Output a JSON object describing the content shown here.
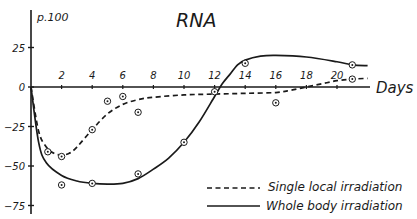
{
  "chart_data": {
    "type": "line",
    "title": "RNA",
    "ylabel": "p.100",
    "xlabel": "Days",
    "xlim": [
      0,
      22
    ],
    "ylim": [
      -75,
      35
    ],
    "x_ticks": [
      2,
      4,
      6,
      8,
      10,
      12,
      14,
      16,
      18,
      20
    ],
    "y_ticks": [
      25,
      0,
      -25,
      -50,
      -75
    ],
    "grid": false,
    "legend_position": "lower right",
    "series": [
      {
        "name": "Single local irradiation",
        "style": "dashed",
        "curve": [
          [
            0,
            0
          ],
          [
            0.5,
            -28
          ],
          [
            1,
            -38
          ],
          [
            1.5,
            -42
          ],
          [
            2,
            -43
          ],
          [
            2.5,
            -42
          ],
          [
            3,
            -38
          ],
          [
            4,
            -27
          ],
          [
            5,
            -17
          ],
          [
            6,
            -11
          ],
          [
            7,
            -8
          ],
          [
            8,
            -6.5
          ],
          [
            10,
            -5
          ],
          [
            12,
            -4.5
          ],
          [
            14,
            -4
          ],
          [
            16,
            -3.5
          ],
          [
            17,
            -2
          ],
          [
            18,
            0
          ],
          [
            19,
            2
          ],
          [
            20,
            4
          ],
          [
            21,
            5
          ],
          [
            22,
            5.5
          ]
        ],
        "points": [
          [
            1.1,
            -41
          ],
          [
            2,
            -44
          ],
          [
            4,
            -27
          ],
          [
            5,
            -9
          ],
          [
            6,
            -6
          ],
          [
            7,
            -16
          ],
          [
            12,
            -3
          ],
          [
            16,
            -10
          ],
          [
            21,
            5
          ]
        ]
      },
      {
        "name": "Whole body irradiation",
        "style": "solid",
        "curve": [
          [
            0,
            0
          ],
          [
            0.5,
            -35
          ],
          [
            1,
            -48
          ],
          [
            2,
            -56
          ],
          [
            3,
            -59.5
          ],
          [
            4,
            -61
          ],
          [
            5,
            -61.5
          ],
          [
            6,
            -61
          ],
          [
            7,
            -58
          ],
          [
            8,
            -52
          ],
          [
            9,
            -45
          ],
          [
            10,
            -35
          ],
          [
            11,
            -22
          ],
          [
            12,
            -6
          ],
          [
            12.5,
            2
          ],
          [
            13,
            8
          ],
          [
            13.5,
            14
          ],
          [
            14,
            17
          ],
          [
            15,
            19.5
          ],
          [
            16,
            20
          ],
          [
            18,
            19
          ],
          [
            20,
            16
          ],
          [
            21,
            14
          ],
          [
            22,
            13.5
          ]
        ],
        "points": [
          [
            2,
            -62
          ],
          [
            4,
            -61
          ],
          [
            7,
            -55
          ],
          [
            10,
            -35
          ],
          [
            14,
            15
          ],
          [
            21,
            14
          ]
        ]
      }
    ]
  },
  "labels": {
    "title": "RNA",
    "y_unit": "p.100",
    "x_unit": "Days",
    "legend_dashed": "Single local irradiation",
    "legend_solid": "Whole body irradiation"
  }
}
